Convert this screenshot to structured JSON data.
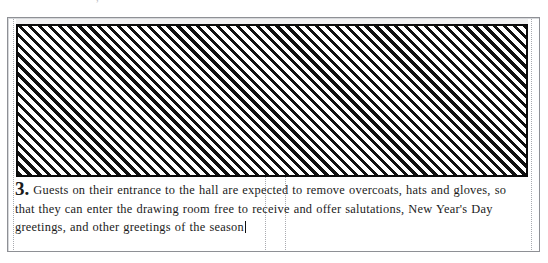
{
  "document": {
    "top_clipped_line": "·· ·      ·   ·     ·      ·    ·   ,  ·· ",
    "hatched_block": {
      "label": "image-placeholder",
      "pattern": "diagonal-hatch-45",
      "border_color": "#0a0a0a",
      "hatch_color": "#111111",
      "background_color": "#ffffff"
    },
    "paragraph": {
      "number": "3.",
      "text": "Guests on their entrance to the hall are expected to remove overcoats, hats and gloves, so that they can enter the drawing room free to receive and offer salutations, New Year's Day greetings, and other greetings of the season",
      "caret_visible": true
    },
    "guides": {
      "left": "margin-guide-left",
      "center_a": "column-guide-a",
      "center_b": "column-guide-b",
      "right": "margin-guide-right"
    },
    "colors": {
      "frame": "#8e9095",
      "guide": "#a9abb0",
      "text": "#1b1b1b",
      "page": "#ffffff"
    }
  }
}
